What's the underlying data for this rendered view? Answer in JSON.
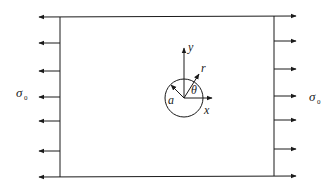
{
  "figure": {
    "colors": {
      "stroke": "#1a1a1a",
      "background": "#ffffff"
    },
    "labels": {
      "stress_left": "σ",
      "stress_left_sub": "0",
      "stress_right": "σ",
      "stress_right_sub": "0",
      "y_axis": "y",
      "x_axis": "x",
      "radial": "r",
      "angle": "θ",
      "radius": "a"
    },
    "load": {
      "arrows_per_side": 7,
      "left_direction": "left",
      "right_direction": "right"
    }
  }
}
